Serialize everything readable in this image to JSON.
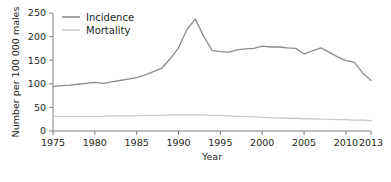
{
  "chart_data": {
    "type": "line",
    "title": "",
    "xlabel": "Year",
    "ylabel": "Number per 100 000 males",
    "xlim": [
      1975,
      2013
    ],
    "ylim": [
      0,
      250
    ],
    "grid": false,
    "legend_position": "top-left",
    "xticks": [
      1975,
      1980,
      1985,
      1990,
      1995,
      2000,
      2005,
      2010,
      2013
    ],
    "xtick_labels": [
      "1975",
      "1980",
      "1985",
      "1990",
      "1995",
      "2000",
      "2005",
      "2010",
      "2013"
    ],
    "yticks": [
      0,
      50,
      100,
      150,
      200,
      250
    ],
    "ytick_labels": [
      "0",
      "50",
      "100",
      "150",
      "200",
      "250"
    ],
    "x": [
      1975,
      1976,
      1977,
      1978,
      1979,
      1980,
      1981,
      1982,
      1983,
      1984,
      1985,
      1986,
      1987,
      1988,
      1989,
      1990,
      1991,
      1992,
      1993,
      1994,
      1995,
      1996,
      1997,
      1998,
      1999,
      2000,
      2001,
      2002,
      2003,
      2004,
      2005,
      2006,
      2007,
      2008,
      2009,
      2010,
      2011,
      2012,
      2013
    ],
    "series": [
      {
        "name": "Incidence",
        "color": "#8c8c8c",
        "values": [
          94,
          96,
          97,
          99,
          101,
          103,
          101,
          104,
          107,
          110,
          113,
          119,
          126,
          133,
          153,
          176,
          215,
          237,
          201,
          171,
          168,
          167,
          172,
          174,
          175,
          180,
          178,
          178,
          176,
          175,
          163,
          170,
          176,
          167,
          157,
          149,
          146,
          123,
          107
        ]
      },
      {
        "name": "Mortality",
        "color": "#c9c9c9",
        "values": [
          31,
          31,
          31,
          31,
          31,
          31,
          31,
          32,
          32,
          32,
          32,
          33,
          33,
          33,
          34,
          34,
          34,
          34,
          34,
          33,
          33,
          32,
          31,
          31,
          30,
          29,
          28,
          28,
          27,
          27,
          26,
          26,
          25,
          25,
          24,
          24,
          23,
          23,
          22
        ]
      }
    ]
  },
  "legend": {
    "items": [
      {
        "label": "Incidence",
        "color": "#8c8c8c"
      },
      {
        "label": "Mortality",
        "color": "#c9c9c9"
      }
    ]
  },
  "axes": {
    "x_title": "Year",
    "y_title": "Number per 100 000 males"
  }
}
